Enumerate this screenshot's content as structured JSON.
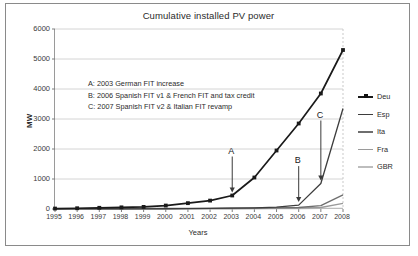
{
  "chart_data": {
    "type": "line",
    "title": "Cumulative installed PV power",
    "xlabel": "Years",
    "ylabel": "MW",
    "x": [
      1995,
      1996,
      1997,
      1998,
      1999,
      2000,
      2001,
      2002,
      2003,
      2004,
      2005,
      2006,
      2007,
      2008
    ],
    "xticklabels": [
      "1995",
      "1996",
      "1997",
      "1998",
      "1999",
      "2000",
      "2001",
      "2002",
      "2003",
      "2004",
      "2005",
      "2006",
      "2007",
      "2008"
    ],
    "yticklabels": [
      "0",
      "1000",
      "2000",
      "3000",
      "4000",
      "5000",
      "6000"
    ],
    "ylim": [
      0,
      6000
    ],
    "xlim": [
      1995,
      2008
    ],
    "ytick_step": 1000,
    "grid": "horizontal",
    "legend_position": "right",
    "series": [
      {
        "name": "Deu",
        "color": "#1a1a1a",
        "marker": "square",
        "values": [
          15,
          25,
          40,
          55,
          70,
          115,
          195,
          280,
          450,
          1050,
          1950,
          2850,
          3850,
          5300
        ]
      },
      {
        "name": "Esp",
        "color": "#3d3d3d",
        "marker": "none",
        "values": [
          1,
          2,
          3,
          4,
          5,
          8,
          12,
          18,
          28,
          40,
          60,
          130,
          850,
          3350
        ]
      },
      {
        "name": "Ita",
        "color": "#6e6e6e",
        "marker": "none",
        "values": [
          12,
          14,
          16,
          17,
          18,
          19,
          20,
          22,
          26,
          31,
          37,
          50,
          110,
          470
        ]
      },
      {
        "name": "Fra",
        "color": "#9a9a9a",
        "marker": "none",
        "values": [
          2,
          3,
          4,
          5,
          6,
          8,
          10,
          13,
          17,
          22,
          26,
          33,
          50,
          190
        ]
      },
      {
        "name": "GBR",
        "color": "#bdbdbd",
        "marker": "none",
        "values": [
          1,
          1,
          2,
          2,
          3,
          3,
          4,
          5,
          6,
          8,
          11,
          14,
          18,
          23
        ]
      }
    ],
    "annotations": [
      {
        "id": "A",
        "text": "A: 2003 German FIT increase",
        "point_x": 2003,
        "point_y": 450
      },
      {
        "id": "B",
        "text": "B: 2006 Spanish FIT v1 & French FIT and tax credit",
        "point_x": 2006,
        "point_y": 130
      },
      {
        "id": "C",
        "text": "C: 2007 Spanish FIT v2 & Italian FIT revamp",
        "point_x": 2007,
        "point_y": 850
      }
    ]
  }
}
